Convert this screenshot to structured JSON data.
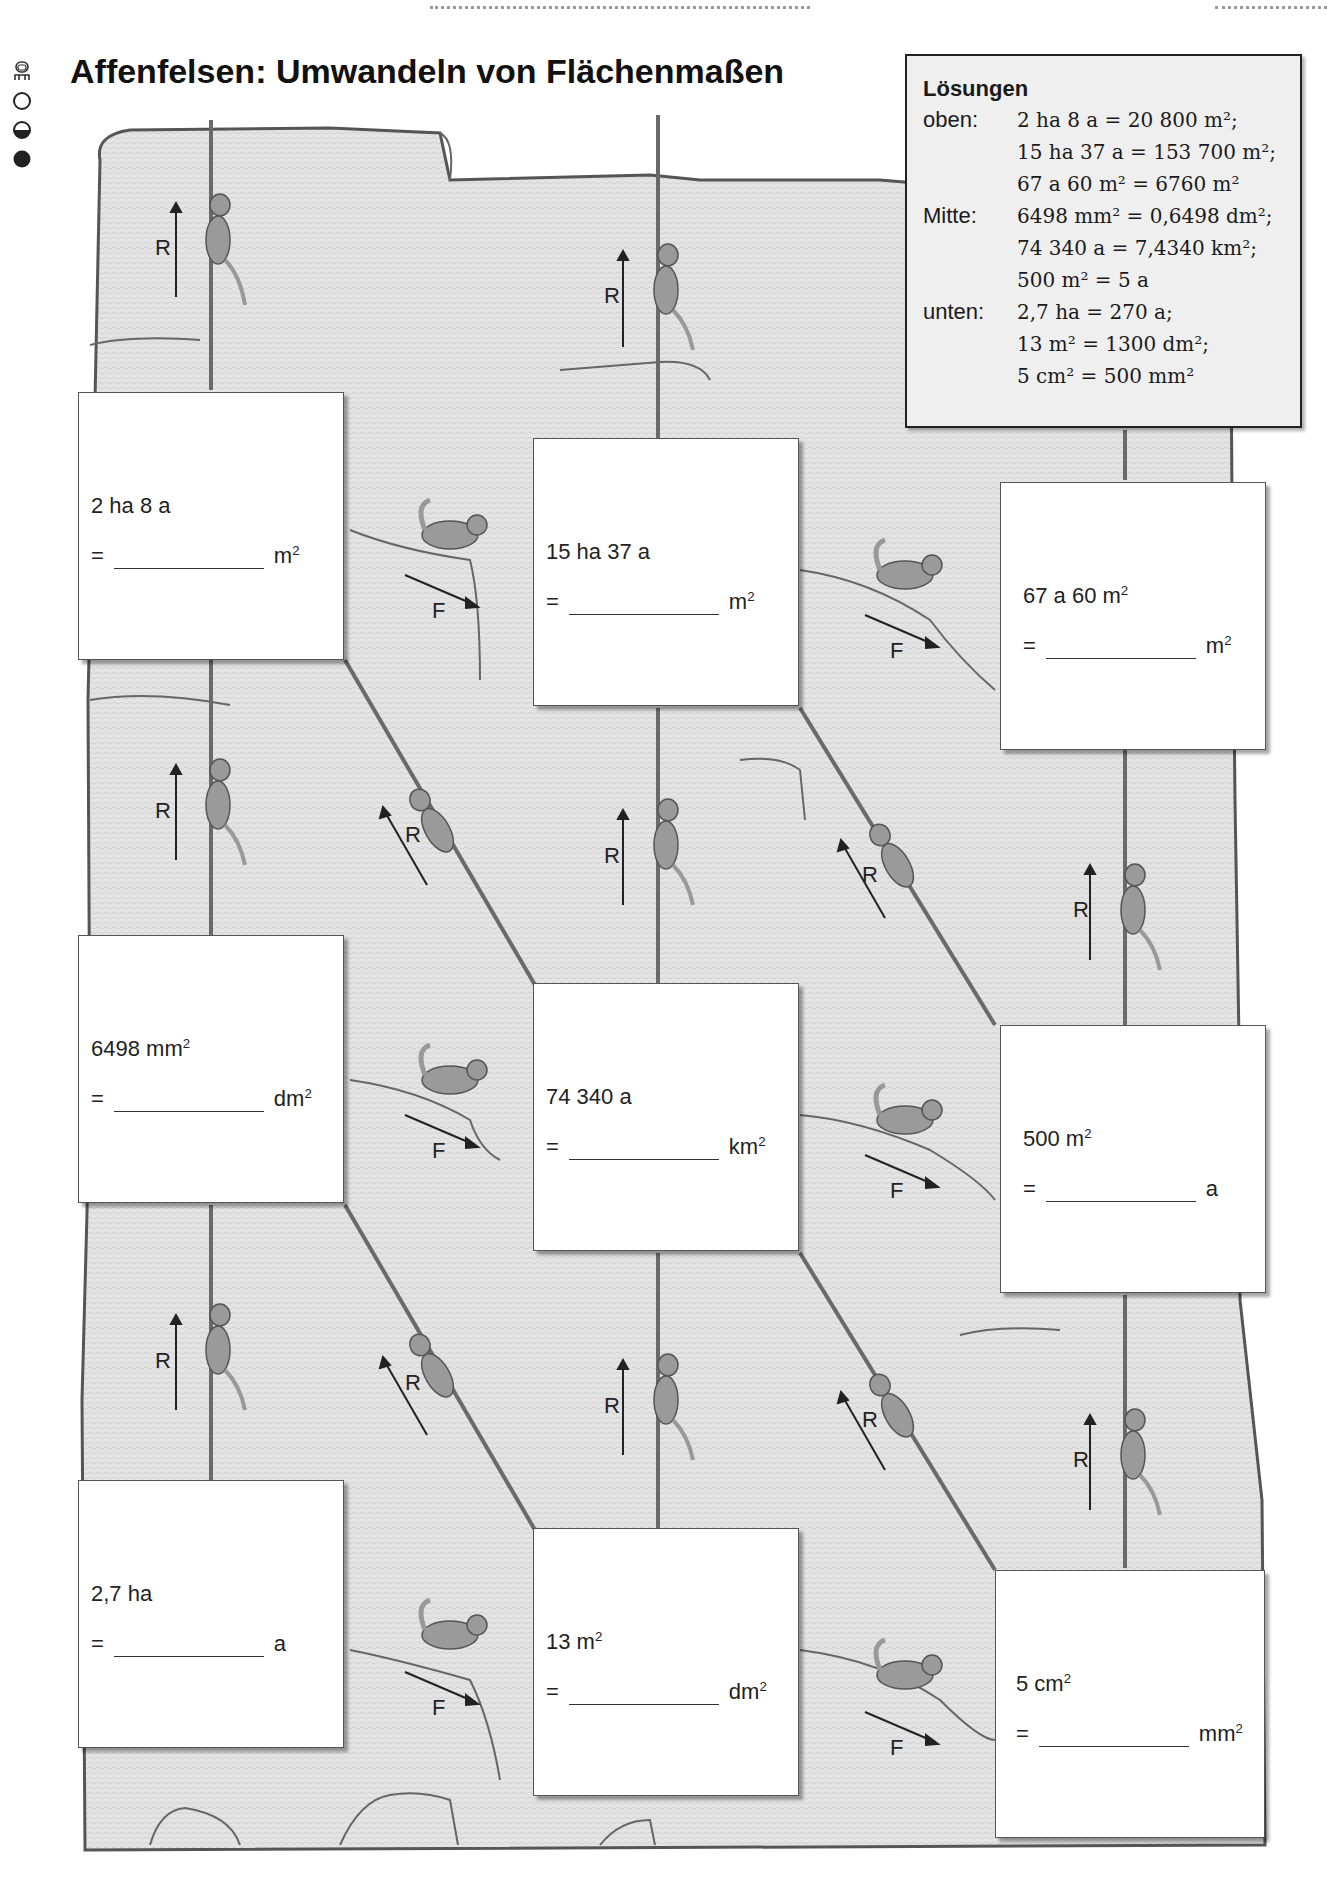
{
  "page": {
    "title": "Affenfelsen: Umwandeln von Flächenmaßen",
    "difficulty_levels": [
      {
        "icon": "partner-work-icon"
      },
      {
        "icon": "level-easy-empty-circle-icon"
      },
      {
        "icon": "level-medium-half-circle-icon"
      },
      {
        "icon": "level-hard-filled-circle-icon"
      }
    ]
  },
  "legend": {
    "up_label": "R",
    "down_label": "F"
  },
  "tasks": [
    {
      "id": "oben-1",
      "row": "oben",
      "given": "2 ha 8 a",
      "given_sup": "",
      "eq": "=",
      "unit": "m",
      "unit_sup": "2",
      "answer": ""
    },
    {
      "id": "oben-2",
      "row": "oben",
      "given": "15 ha 37 a",
      "given_sup": "",
      "eq": "=",
      "unit": "m",
      "unit_sup": "2",
      "answer": ""
    },
    {
      "id": "oben-3",
      "row": "oben",
      "given": "67 a 60 m",
      "given_sup": "2",
      "eq": "=",
      "unit": "m",
      "unit_sup": "2",
      "answer": ""
    },
    {
      "id": "mitte-1",
      "row": "mitte",
      "given": "6498 mm",
      "given_sup": "2",
      "eq": "=",
      "unit": "dm",
      "unit_sup": "2",
      "answer": ""
    },
    {
      "id": "mitte-2",
      "row": "mitte",
      "given": "74 340 a",
      "given_sup": "",
      "eq": "=",
      "unit": "km",
      "unit_sup": "2",
      "answer": ""
    },
    {
      "id": "mitte-3",
      "row": "mitte",
      "given": "500 m",
      "given_sup": "2",
      "eq": "=",
      "unit": "a",
      "unit_sup": "",
      "answer": ""
    },
    {
      "id": "unten-1",
      "row": "unten",
      "given": "2,7 ha",
      "given_sup": "",
      "eq": "=",
      "unit": "a",
      "unit_sup": "",
      "answer": ""
    },
    {
      "id": "unten-2",
      "row": "unten",
      "given": "13 m",
      "given_sup": "2",
      "eq": "=",
      "unit": "dm",
      "unit_sup": "2",
      "answer": ""
    },
    {
      "id": "unten-3",
      "row": "unten",
      "given": "5 cm",
      "given_sup": "2",
      "eq": "=",
      "unit": "mm",
      "unit_sup": "2",
      "answer": ""
    }
  ],
  "solutions": {
    "title": "Lösungen",
    "groups": [
      {
        "label": "oben:",
        "lines": [
          "2 ha 8 a = 20 800 m²;",
          "15 ha 37 a = 153 700 m²;",
          "67 a 60 m² = 6760 m²"
        ]
      },
      {
        "label": "Mitte:",
        "lines": [
          "6498 mm² = 0,6498 dm²;",
          "74 340 a = 7,4340 km²;",
          "500 m² = 5 a"
        ]
      },
      {
        "label": "unten:",
        "lines": [
          "2,7 ha = 270 a;",
          "13 m² = 1300 dm²;",
          "5 cm² = 500 mm²"
        ]
      }
    ]
  },
  "colors": {
    "rock_fill": "#e2e2e2",
    "rock_line": "#555555",
    "rope": "#6a6a6a",
    "monkey": "#9a9a9a",
    "solution_bg": "#efefef"
  }
}
